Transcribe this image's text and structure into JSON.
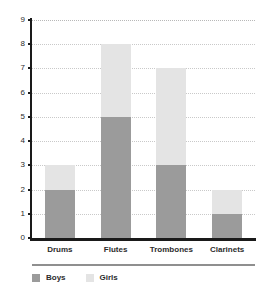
{
  "chart_data": {
    "type": "bar",
    "subtype": "stacked-vertical-bar",
    "title": "",
    "subtitle": "",
    "xlabel": "",
    "ylabel": "",
    "categories": [
      "Drums",
      "Flutes",
      "Trombones",
      "Clarinets"
    ],
    "series": [
      {
        "name": "Boys",
        "values": [
          2,
          5,
          3,
          1
        ],
        "color": "#9b9b9b"
      },
      {
        "name": "Girls",
        "values": [
          1,
          3,
          4,
          1
        ],
        "color": "#e4e4e4"
      }
    ],
    "totals": [
      3,
      8,
      7,
      2
    ],
    "ylim": [
      0,
      9
    ],
    "ytick_values": [
      0,
      1,
      2,
      3,
      4,
      5,
      6,
      7,
      8,
      9
    ],
    "ytick_labels": [
      "0",
      "1",
      "2",
      "3",
      "4",
      "5",
      "6",
      "7",
      "8",
      "9"
    ],
    "grid": true,
    "grid_axis": "y",
    "grid_style": "dotted",
    "grid_color": "#c9c9c9",
    "legend_position": "bottom-left",
    "legend_entries": [
      "Boys",
      "Girls"
    ],
    "axis_color": "#1a1a1a",
    "background_color": "#ffffff",
    "annotations": []
  },
  "legend": {
    "items": [
      {
        "label": "Boys",
        "color": "#9b9b9b"
      },
      {
        "label": "Girls",
        "color": "#e4e4e4"
      }
    ]
  }
}
